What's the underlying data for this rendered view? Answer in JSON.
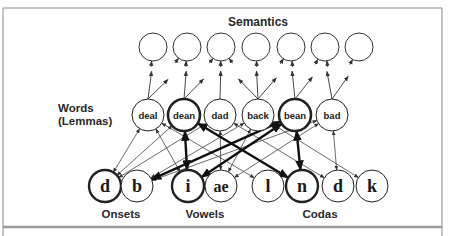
{
  "diagram": {
    "title": "Semantics",
    "words_label_line1": "Words",
    "words_label_line2": "(Lemmas)",
    "group_labels": {
      "onsets": "Onsets",
      "vowels": "Vowels",
      "codas": "Codas"
    },
    "semantic_nodes": [
      {
        "id": "s1",
        "x": 153
      },
      {
        "id": "s2",
        "x": 187
      },
      {
        "id": "s3",
        "x": 221
      },
      {
        "id": "s4",
        "x": 256
      },
      {
        "id": "s5",
        "x": 291
      },
      {
        "id": "s6",
        "x": 325
      },
      {
        "id": "s7",
        "x": 359
      }
    ],
    "word_nodes": [
      {
        "id": "deal",
        "label": "deal",
        "x": 148,
        "active": false
      },
      {
        "id": "dean",
        "label": "dean",
        "x": 184,
        "active": true
      },
      {
        "id": "dad",
        "label": "dad",
        "x": 220,
        "active": false
      },
      {
        "id": "back",
        "label": "back",
        "x": 258,
        "active": false
      },
      {
        "id": "bean",
        "label": "bean",
        "x": 295,
        "active": true
      },
      {
        "id": "bad",
        "label": "bad",
        "x": 332,
        "active": false
      }
    ],
    "phoneme_nodes": [
      {
        "id": "on_d",
        "label": "d",
        "group": "onset",
        "x": 105,
        "active": true
      },
      {
        "id": "on_b",
        "label": "b",
        "group": "onset",
        "x": 137,
        "active": false
      },
      {
        "id": "v_i",
        "label": "i",
        "group": "vowel",
        "x": 188,
        "active": true
      },
      {
        "id": "v_ae",
        "label": "ae",
        "group": "vowel",
        "x": 221,
        "active": false
      },
      {
        "id": "c_l",
        "label": "l",
        "group": "coda",
        "x": 268,
        "active": false
      },
      {
        "id": "c_n",
        "label": "n",
        "group": "coda",
        "x": 302,
        "active": true
      },
      {
        "id": "c_d",
        "label": "d",
        "group": "coda",
        "x": 338,
        "active": false
      },
      {
        "id": "c_k",
        "label": "k",
        "group": "coda",
        "x": 372,
        "active": false
      }
    ],
    "word_to_semantic_arrows": [
      {
        "from": "deal",
        "to": "s1"
      },
      {
        "from": "deal",
        "to": "s2"
      },
      {
        "from": "dean",
        "to": "s2"
      },
      {
        "from": "dean",
        "to": "s3"
      },
      {
        "from": "dad",
        "to": "s3"
      },
      {
        "from": "back",
        "to": "s3"
      },
      {
        "from": "back",
        "to": "s4"
      },
      {
        "from": "back",
        "to": "s5"
      },
      {
        "from": "bean",
        "to": "s5"
      },
      {
        "from": "bean",
        "to": "s6"
      },
      {
        "from": "bad",
        "to": "s6"
      },
      {
        "from": "bad",
        "to": "s7"
      }
    ],
    "word_phoneme_links": [
      {
        "word": "deal",
        "phoneme": "on_d",
        "active": false
      },
      {
        "word": "deal",
        "phoneme": "v_i",
        "active": false
      },
      {
        "word": "deal",
        "phoneme": "c_l",
        "active": false
      },
      {
        "word": "dean",
        "phoneme": "on_d",
        "active": false
      },
      {
        "word": "dean",
        "phoneme": "v_i",
        "active": true
      },
      {
        "word": "dean",
        "phoneme": "c_n",
        "active": true
      },
      {
        "word": "dad",
        "phoneme": "on_d",
        "active": false
      },
      {
        "word": "dad",
        "phoneme": "v_ae",
        "active": false
      },
      {
        "word": "dad",
        "phoneme": "c_d",
        "active": false
      },
      {
        "word": "back",
        "phoneme": "on_b",
        "active": false
      },
      {
        "word": "back",
        "phoneme": "v_ae",
        "active": false
      },
      {
        "word": "back",
        "phoneme": "c_k",
        "active": false
      },
      {
        "word": "bean",
        "phoneme": "on_b",
        "active": true
      },
      {
        "word": "bean",
        "phoneme": "v_i",
        "active": true
      },
      {
        "word": "bean",
        "phoneme": "c_n",
        "active": true
      },
      {
        "word": "bad",
        "phoneme": "on_b",
        "active": false
      },
      {
        "word": "bad",
        "phoneme": "v_ae",
        "active": false
      },
      {
        "word": "bad",
        "phoneme": "c_d",
        "active": false
      }
    ],
    "colors": {
      "stroke": "#333333",
      "active_stroke": "#111111",
      "frame": "#8a8a8a",
      "bottom_rule": "#9a9a9a"
    }
  }
}
